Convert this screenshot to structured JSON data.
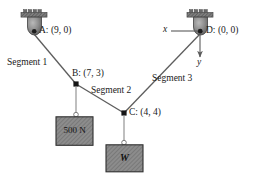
{
  "figure": {
    "colors": {
      "line": "#555555",
      "cable": "#7a7a7a",
      "block_fill": "#8c8c8c",
      "block_stroke": "#3a3a3a",
      "bracket_fill": "#6e6e6e",
      "pulley_fill": "#8a8a8a",
      "text": "#1a1a1a",
      "background": "#ffffff"
    },
    "anchors": [
      {
        "id": "anchor-a",
        "label": "A: (9, 0)",
        "point_letter": "A",
        "coords": "(9, 0)",
        "x": 34,
        "y": 31
      },
      {
        "id": "anchor-d",
        "label": "D: (0, 0)",
        "point_letter": "D",
        "coords": "(0, 0)",
        "x": 200,
        "y": 31
      }
    ],
    "nodes": [
      {
        "id": "node-b",
        "label": "B: (7, 3)",
        "point_letter": "B",
        "coords": "(7, 3)",
        "x": 76,
        "y": 84
      },
      {
        "id": "node-c",
        "label": "C: (4, 4)",
        "point_letter": "C",
        "coords": "(4, 4)",
        "x": 124,
        "y": 113
      }
    ],
    "segments": [
      {
        "id": "segment-1",
        "label": "Segment 1",
        "from": "A",
        "to": "B"
      },
      {
        "id": "segment-2",
        "label": "Segment 2",
        "from": "B",
        "to": "C"
      },
      {
        "id": "segment-3",
        "label": "Segment 3",
        "from": "C",
        "to": "D"
      }
    ],
    "axes": {
      "x_label": "x",
      "y_label": "y",
      "origin": "D"
    },
    "blocks": [
      {
        "id": "block-500n",
        "label": "500 N",
        "hangs_from": "B",
        "italic": false
      },
      {
        "id": "block-w",
        "label": "W",
        "hangs_from": "C",
        "italic": true
      }
    ]
  }
}
